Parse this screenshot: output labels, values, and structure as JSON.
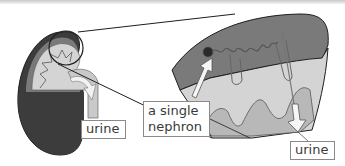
{
  "diagram": {
    "type": "kidney-nephron-illustration",
    "labels": {
      "urine_left": "urine",
      "nephron_line1": "a single",
      "nephron_line2": "nephron",
      "urine_right": "urine"
    },
    "colors": {
      "outer_cortex_dark": "#3c3c3c",
      "cortex_mid": "#7a7a7a",
      "medulla_light": "#d4d4d4",
      "pyramid_mid": "#b8b8b8",
      "ureter": "#c9c9c9",
      "outline": "#1e1e1e",
      "label_border": "#8a8a8a",
      "label_text": "#3a3a3a"
    }
  }
}
